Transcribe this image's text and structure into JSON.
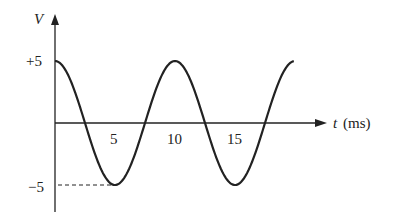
{
  "chart_data": {
    "type": "line",
    "title": "",
    "xlabel": "t (ms)",
    "xlabel_var": "t",
    "xlabel_unit": "(ms)",
    "ylabel": "V",
    "function": "V(t) = 5 cos(2π t / 10)",
    "amplitude": 5,
    "period_ms": 10,
    "x_ticks": [
      "5",
      "10",
      "15"
    ],
    "y_ticks": [
      "+5",
      "−5"
    ],
    "xlim": [
      0,
      20
    ],
    "ylim": [
      -5,
      5
    ],
    "grid": false,
    "legend": null,
    "annotations": [
      "dashed line from −5 on V axis to trough at t=5 ms"
    ],
    "series": [
      {
        "name": "V",
        "x": [
          0,
          2.5,
          5,
          7.5,
          10,
          12.5,
          15,
          17.5,
          20
        ],
        "values": [
          5,
          0,
          -5,
          0,
          5,
          0,
          -5,
          0,
          5
        ]
      }
    ]
  }
}
